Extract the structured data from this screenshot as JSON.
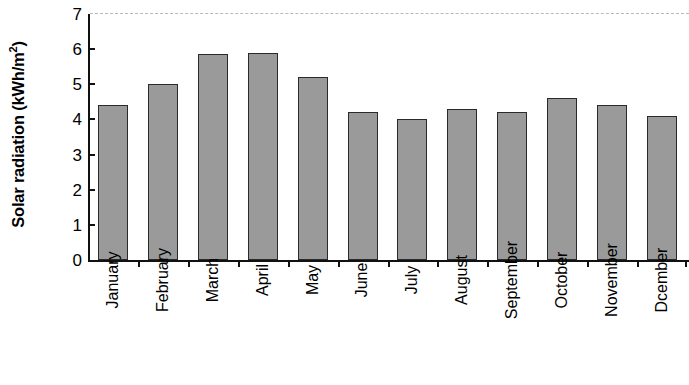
{
  "chart_data": {
    "type": "bar",
    "title": "",
    "subtitle": "",
    "xlabel": "",
    "ylabel": "Solar radiation (kWh/m2)",
    "ylabel_parts": {
      "main": "Solar radiation (kWh/m",
      "superscript": "2",
      "tail": ")"
    },
    "categories": [
      "January",
      "February",
      "March",
      "April",
      "May",
      "June",
      "July",
      "August",
      "September",
      "October",
      "November",
      "Dcember"
    ],
    "values": [
      4.4,
      5.0,
      5.85,
      5.9,
      5.2,
      4.2,
      4.0,
      4.3,
      4.2,
      4.6,
      4.4,
      4.1
    ],
    "ylim": [
      0,
      7
    ],
    "ytick_labels": [
      "7",
      "6",
      "5",
      "4",
      "3",
      "2",
      "1",
      "0"
    ],
    "ytick_values": [
      7,
      6,
      5,
      4,
      3,
      2,
      1,
      0
    ],
    "grid": "top-dashed-only",
    "legend": "none",
    "bar_fill_color": "#9a9a9a",
    "bar_edge_color": "#2a2a2a",
    "axis_color": "#111111",
    "gridline_color": "#b9b9b9",
    "background_color": "#ffffff"
  }
}
